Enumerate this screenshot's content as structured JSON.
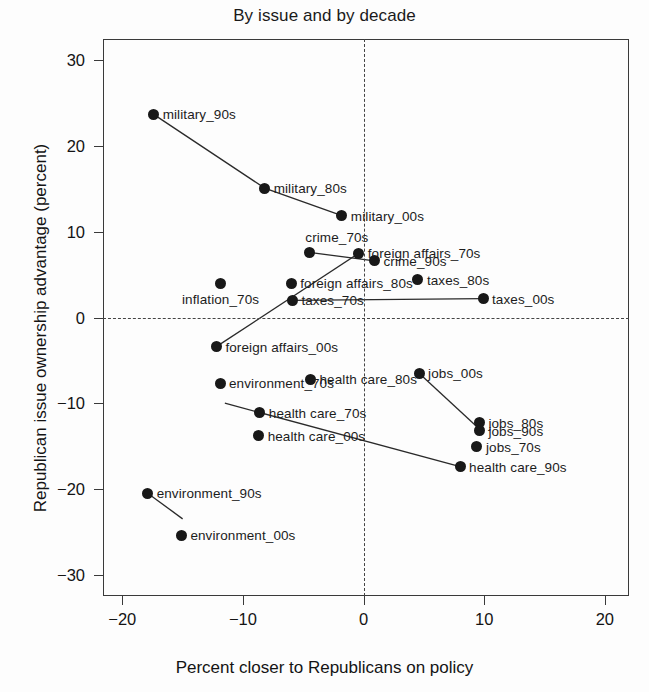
{
  "chart_data": {
    "type": "scatter",
    "title": "By issue and by decade",
    "xlabel": "Percent closer to Republicans on policy",
    "ylabel": "Republican issue ownership advantage (percent)",
    "xlim": [
      -21.6,
      22.0
    ],
    "ylim": [
      -32.5,
      32.5
    ],
    "xticks": [
      -20,
      -10,
      0,
      10,
      20
    ],
    "xtick_labels": [
      "−20",
      "−10",
      "0",
      "10",
      "20"
    ],
    "yticks": [
      30,
      20,
      10,
      0,
      -10,
      -20,
      -30
    ],
    "ytick_labels": [
      "30",
      "20",
      "10",
      "0",
      "−10",
      "−20",
      "−30"
    ],
    "grid": false,
    "legend": "none",
    "reference_lines": [
      {
        "axis": "x",
        "value": 0,
        "style": "dashed"
      },
      {
        "axis": "y",
        "value": 0,
        "style": "dashed"
      }
    ],
    "points": [
      {
        "label": "military_90s",
        "x": -17.4,
        "y": 23.7,
        "label_side": "right"
      },
      {
        "label": "military_80s",
        "x": -8.2,
        "y": 15.1,
        "label_side": "right"
      },
      {
        "label": "military_00s",
        "x": -1.8,
        "y": 11.9,
        "label_side": "right"
      },
      {
        "label": "crime_70s",
        "x": -4.5,
        "y": 7.6,
        "label_side": "above"
      },
      {
        "label": "foreign affairs_70s",
        "x": -0.4,
        "y": 7.5,
        "label_side": "right"
      },
      {
        "label": "crime_90s",
        "x": 0.9,
        "y": 6.6,
        "label_side": "right"
      },
      {
        "label": "foreign affairs_80s",
        "x": -6.0,
        "y": 4.0,
        "label_side": "right"
      },
      {
        "label": "taxes_80s",
        "x": 4.5,
        "y": 4.4,
        "label_side": "right"
      },
      {
        "label": "inflation_70s",
        "x": -11.9,
        "y": 4.0,
        "label_side": "below"
      },
      {
        "label": "taxes_70s",
        "x": -5.9,
        "y": 2.0,
        "label_side": "right"
      },
      {
        "label": "taxes_00s",
        "x": 9.9,
        "y": 2.2,
        "label_side": "right"
      },
      {
        "label": "foreign affairs_00s",
        "x": -12.2,
        "y": -3.4,
        "label_side": "right"
      },
      {
        "label": "jobs_00s",
        "x": 4.6,
        "y": -6.5,
        "label_side": "right"
      },
      {
        "label": "health care_80s",
        "x": -4.4,
        "y": -7.2,
        "label_side": "right"
      },
      {
        "label": "environment_70s",
        "x": -11.9,
        "y": -7.7,
        "label_side": "right"
      },
      {
        "label": "health care_70s",
        "x": -8.6,
        "y": -11.1,
        "label_side": "right"
      },
      {
        "label": "jobs_80s",
        "x": 9.6,
        "y": -12.3,
        "label_side": "right"
      },
      {
        "label": "jobs_90s",
        "x": 9.6,
        "y": -13.2,
        "label_side": "right"
      },
      {
        "label": "health care_00s",
        "x": -8.7,
        "y": -13.8,
        "label_side": "right"
      },
      {
        "label": "jobs_70s",
        "x": 9.4,
        "y": -15.1,
        "label_side": "right"
      },
      {
        "label": "health care_90s",
        "x": 8.0,
        "y": -17.4,
        "label_side": "right"
      },
      {
        "label": "environment_90s",
        "x": -17.9,
        "y": -20.5,
        "label_side": "right"
      },
      {
        "label": "environment_00s",
        "x": -15.1,
        "y": -25.4,
        "label_side": "right"
      }
    ],
    "series_lines": [
      {
        "name": "military",
        "path": [
          [
            -17.4,
            23.7
          ],
          [
            -8.2,
            15.1
          ],
          [
            -1.8,
            11.9
          ]
        ]
      },
      {
        "name": "crime",
        "path": [
          [
            -4.5,
            7.6
          ],
          [
            0.9,
            6.6
          ]
        ]
      },
      {
        "name": "foreign affairs",
        "path": [
          [
            -12.2,
            -3.4
          ],
          [
            -0.4,
            7.5
          ]
        ]
      },
      {
        "name": "taxes",
        "path": [
          [
            -5.9,
            2.0
          ],
          [
            9.9,
            2.2
          ]
        ]
      },
      {
        "name": "health care",
        "path": [
          [
            -11.5,
            -10.0
          ],
          [
            8.0,
            -17.4
          ]
        ]
      },
      {
        "name": "jobs",
        "path": [
          [
            4.6,
            -6.5
          ],
          [
            9.6,
            -13.0
          ]
        ]
      },
      {
        "name": "environment",
        "path": [
          [
            -17.9,
            -20.5
          ],
          [
            -15.0,
            -23.5
          ]
        ]
      }
    ]
  },
  "style": {
    "marker_color": "#181818",
    "axis_color": "#3a3a3a",
    "text_color": "#141414"
  }
}
